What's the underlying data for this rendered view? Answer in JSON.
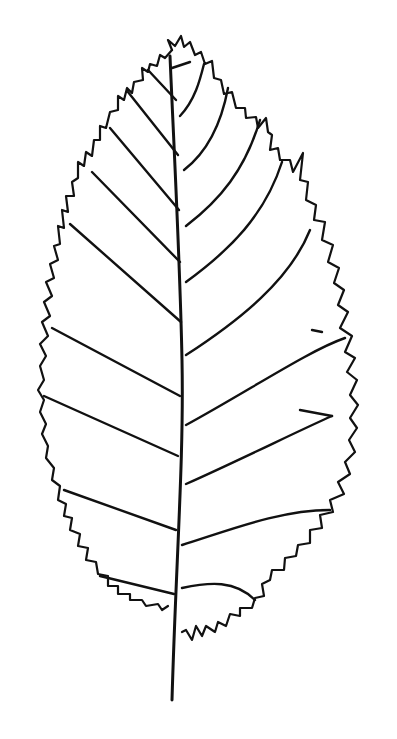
{
  "image": {
    "subject": "leaf line drawing",
    "style": "black ink on white",
    "colors": {
      "background": "#ffffff",
      "ink": "#111111"
    }
  }
}
